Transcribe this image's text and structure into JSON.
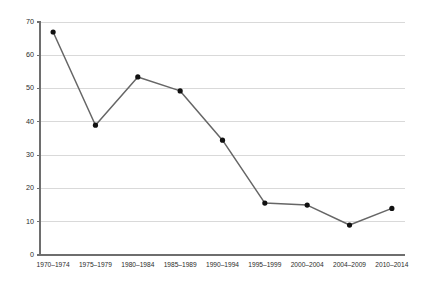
{
  "chart_data": {
    "type": "line",
    "title": "",
    "subtitle": "",
    "xlabel": "",
    "ylabel": "",
    "categories": [
      "1970–1974",
      "1975–1979",
      "1980–1984",
      "1985–1989",
      "1990–1994",
      "1995–1999",
      "2000–2004",
      "2004–2009",
      "2010–2014"
    ],
    "values": [
      67.0,
      39.0,
      53.5,
      49.3,
      34.5,
      15.6,
      15.0,
      9.0,
      14.0
    ],
    "series": [
      {
        "name": "",
        "values": [
          67.0,
          39.0,
          53.5,
          49.3,
          34.5,
          15.6,
          15.0,
          9.0,
          14.0
        ]
      }
    ],
    "ylim": [
      0,
      70
    ],
    "yticks": [
      0,
      10,
      20,
      30,
      40,
      50,
      60,
      70
    ],
    "ytick_labels": [
      "0",
      "10",
      "20",
      "30",
      "40",
      "50",
      "60",
      "70"
    ],
    "xlim": [
      0,
      8
    ],
    "grid": true,
    "grid_axis": "y",
    "legend": false,
    "legend_position": "none",
    "annotations": [],
    "colors": {
      "line": "#666666",
      "marker": "#111111",
      "grid": "#d9d9d9",
      "axis": "#6e6e6e",
      "text": "#2b2b2b",
      "background": "#ffffff"
    },
    "marker_style": "circle"
  }
}
